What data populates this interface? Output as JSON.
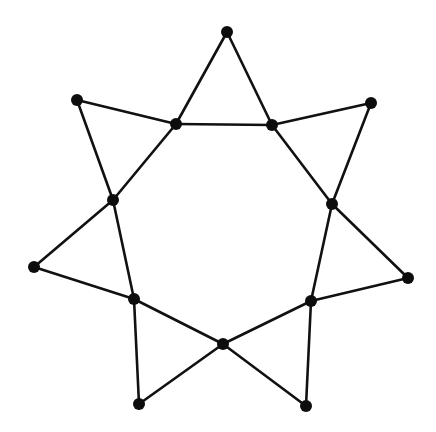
{
  "diagram": {
    "type": "graph",
    "node_color": "#0d0d0d",
    "edge_color": "#111111",
    "background": "#ffffff",
    "node_radius": 6,
    "nodes": [
      {
        "id": "i0",
        "role": "inner",
        "x": 176,
        "y": 124
      },
      {
        "id": "i1",
        "role": "inner",
        "x": 272,
        "y": 125
      },
      {
        "id": "i2",
        "role": "inner",
        "x": 332,
        "y": 204
      },
      {
        "id": "i3",
        "role": "inner",
        "x": 311,
        "y": 301
      },
      {
        "id": "i4",
        "role": "inner",
        "x": 223,
        "y": 344
      },
      {
        "id": "i5",
        "role": "inner",
        "x": 134,
        "y": 299
      },
      {
        "id": "i6",
        "role": "inner",
        "x": 113,
        "y": 200
      },
      {
        "id": "o0",
        "role": "outer",
        "x": 227,
        "y": 32
      },
      {
        "id": "o1",
        "role": "outer",
        "x": 371,
        "y": 103
      },
      {
        "id": "o2",
        "role": "outer",
        "x": 408,
        "y": 278
      },
      {
        "id": "o3",
        "role": "outer",
        "x": 306,
        "y": 406
      },
      {
        "id": "o4",
        "role": "outer",
        "x": 139,
        "y": 404
      },
      {
        "id": "o5",
        "role": "outer",
        "x": 34,
        "y": 267
      },
      {
        "id": "o6",
        "role": "outer",
        "x": 77,
        "y": 100
      }
    ],
    "edges": [
      [
        "i0",
        "i1"
      ],
      [
        "i0",
        "o0"
      ],
      [
        "o0",
        "i1"
      ],
      [
        "i1",
        "o1"
      ],
      [
        "o1",
        "i2"
      ],
      [
        "i1",
        "i2"
      ],
      [
        "i2",
        "o2"
      ],
      [
        "o2",
        "i3"
      ],
      [
        "i2",
        "i3"
      ],
      [
        "i3",
        "o3"
      ],
      [
        "o3",
        "i4"
      ],
      [
        "i3",
        "i4"
      ],
      [
        "i4",
        "o4"
      ],
      [
        "o4",
        "i5"
      ],
      [
        "i4",
        "i5"
      ],
      [
        "i5",
        "o5"
      ],
      [
        "o5",
        "i6"
      ],
      [
        "i5",
        "i6"
      ],
      [
        "i6",
        "o6"
      ],
      [
        "o6",
        "i0"
      ],
      [
        "i6",
        "i0"
      ]
    ]
  }
}
